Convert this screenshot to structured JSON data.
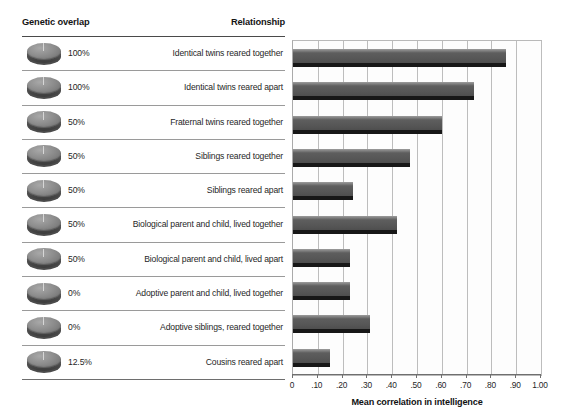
{
  "table": {
    "header": {
      "genetic_overlap": "Genetic overlap",
      "relationship": "Relationship"
    },
    "rows": [
      {
        "icon": "pie-token-full-icon",
        "percent": "100%",
        "relationship": "Identical twins reared together",
        "correlation": 0.86
      },
      {
        "icon": "pie-token-full-icon",
        "percent": "100%",
        "relationship": "Identical twins reared apart",
        "correlation": 0.73
      },
      {
        "icon": "pie-token-half-icon",
        "percent": "50%",
        "relationship": "Fraternal twins reared together",
        "correlation": 0.6
      },
      {
        "icon": "pie-token-half-icon",
        "percent": "50%",
        "relationship": "Siblings reared together",
        "correlation": 0.47
      },
      {
        "icon": "pie-token-half-icon",
        "percent": "50%",
        "relationship": "Siblings reared apart",
        "correlation": 0.24
      },
      {
        "icon": "pie-token-half-icon",
        "percent": "50%",
        "relationship": "Biological parent and child, lived together",
        "correlation": 0.42
      },
      {
        "icon": "pie-token-half-icon",
        "percent": "50%",
        "relationship": "Biological parent and child, lived apart",
        "correlation": 0.23
      },
      {
        "icon": "pie-token-empty-icon",
        "percent": "0%",
        "relationship": "Adoptive parent and child, lived together",
        "correlation": 0.23
      },
      {
        "icon": "pie-token-empty-icon",
        "percent": "0%",
        "relationship": "Adoptive siblings, reared together",
        "correlation": 0.31
      },
      {
        "icon": "pie-token-eighth-icon",
        "percent": "12.5%",
        "relationship": "Cousins reared apart",
        "correlation": 0.15
      }
    ]
  },
  "chart_data": {
    "type": "bar",
    "orientation": "horizontal",
    "title": "",
    "xlabel": "Mean correlation in intelligence",
    "ylabel": "",
    "xlim": [
      0,
      1.0
    ],
    "xticks": [
      0,
      0.1,
      0.2,
      0.3,
      0.4,
      0.5,
      0.6,
      0.7,
      0.8,
      0.9,
      1.0
    ],
    "xticklabels": [
      "0",
      ".10",
      ".20",
      ".30",
      ".40",
      ".50",
      ".60",
      ".70",
      ".80",
      ".90",
      "1.00"
    ],
    "grid": "vertical",
    "legend": "none",
    "categories": [
      "Identical twins reared together",
      "Identical twins reared apart",
      "Fraternal twins reared together",
      "Siblings reared together",
      "Siblings reared apart",
      "Biological parent and child, lived together",
      "Biological parent and child, lived apart",
      "Adoptive parent and child, lived together",
      "Adoptive siblings, reared together",
      "Cousins reared apart"
    ],
    "values": [
      0.86,
      0.73,
      0.6,
      0.47,
      0.24,
      0.42,
      0.23,
      0.23,
      0.31,
      0.15
    ],
    "genetic_overlap": [
      "100%",
      "100%",
      "50%",
      "50%",
      "50%",
      "50%",
      "50%",
      "0%",
      "0%",
      "12.5%"
    ],
    "bar_color": "#5e5e5e"
  }
}
